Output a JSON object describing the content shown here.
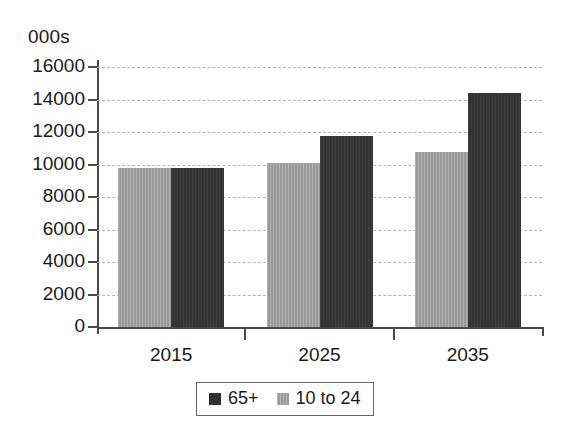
{
  "chart_data": {
    "type": "bar",
    "title": "",
    "subtitle": "",
    "xlabel": "",
    "ylabel": "000s",
    "unit_label": "000s",
    "categories": [
      "2015",
      "2025",
      "2035"
    ],
    "series": [
      {
        "name": "10 to 24",
        "color": "#9a9a9a",
        "values": [
          9800,
          10100,
          10800
        ]
      },
      {
        "name": "65+",
        "color": "#333333",
        "values": [
          9800,
          11750,
          14400
        ]
      }
    ],
    "bar_order_in_group": [
      "10 to 24",
      "65+"
    ],
    "legend_order": [
      "65+",
      "10 to 24"
    ],
    "legend_position": "bottom",
    "ylim": [
      0,
      16000
    ],
    "ytick_step": 2000,
    "yticks": [
      0,
      2000,
      4000,
      6000,
      8000,
      10000,
      12000,
      14000,
      16000
    ],
    "ytick_labels": [
      "0",
      "2000",
      "4000",
      "6000",
      "8000",
      "10000",
      "12000",
      "14000",
      "16000"
    ],
    "grid": true,
    "grid_style": "dashed",
    "grid_color": "#b4b4b4",
    "axis_color": "#4a4a4a",
    "background": "#ffffff"
  },
  "legend": {
    "entries": [
      {
        "label": "65+",
        "swatch": "series-old"
      },
      {
        "label": "10 to 24",
        "swatch": "series-young"
      }
    ]
  }
}
